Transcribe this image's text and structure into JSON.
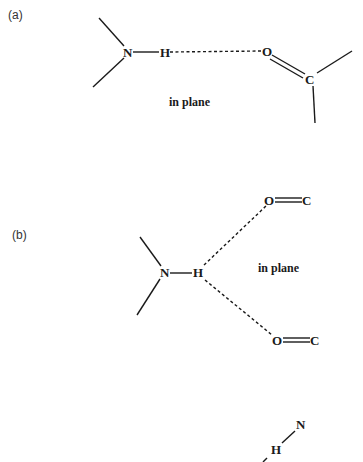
{
  "figure": {
    "panels": [
      {
        "id": "a",
        "label": "(a)",
        "caption": "in plane",
        "atoms": {
          "donor_n": "N",
          "hydrogen": "H",
          "acceptor_o": "O",
          "carbonyl_c": "C"
        },
        "description": "Single linear N-H...O=C hydrogen bond"
      },
      {
        "id": "b",
        "label": "(b)",
        "caption": "in plane",
        "atoms": {
          "donor_n": "N",
          "hydrogen": "H",
          "acceptor_o1": "O",
          "carbonyl_c1": "C",
          "acceptor_o2": "O",
          "carbonyl_c2": "C"
        },
        "description": "Bifurcated N-H hydrogen bond to two C=O acceptors"
      },
      {
        "id": "c",
        "atoms": {
          "donor_n": "N",
          "hydrogen": "H"
        },
        "description": "Partially visible third panel"
      }
    ]
  }
}
